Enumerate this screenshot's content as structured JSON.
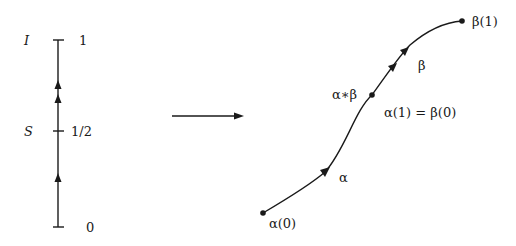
{
  "left_axis": {
    "name_top": "I",
    "name_mid": "S",
    "tick_top": "1",
    "tick_mid": "1/2",
    "tick_bottom": "0"
  },
  "map_arrow": {
    "icon": "right-arrow"
  },
  "path": {
    "start_label": "α(0)",
    "end_label": "β(1)",
    "alpha_label": "α",
    "beta_label": "β",
    "composite_label": "α∗β",
    "junction_label": "α(1) = β(0)"
  }
}
